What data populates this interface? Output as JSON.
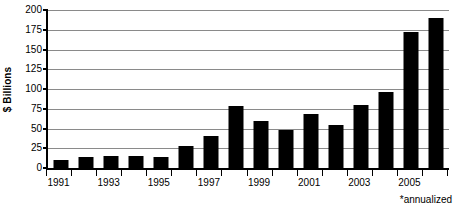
{
  "chart_data": {
    "type": "bar",
    "title": "",
    "xlabel": "",
    "ylabel": "$ Billions",
    "ylim": [
      0,
      200
    ],
    "yticks": [
      0,
      25,
      50,
      75,
      100,
      125,
      150,
      175,
      200
    ],
    "ytick_labels": [
      "0",
      "25",
      "50",
      "75",
      "100",
      "125",
      "150",
      "175",
      "200"
    ],
    "grid": true,
    "legend": null,
    "categories": [
      "1991",
      "1992",
      "1993",
      "1994",
      "1995",
      "1996",
      "1997",
      "1998",
      "1999",
      "2000",
      "2001",
      "2002",
      "2003",
      "2004",
      "2005",
      "2006"
    ],
    "xtick_labels_visible": [
      "1991",
      "",
      "1993",
      "",
      "1995",
      "",
      "1997",
      "",
      "1999",
      "",
      "2001",
      "",
      "2003",
      "",
      "2005",
      ""
    ],
    "values": [
      10,
      14,
      15,
      15,
      14,
      28,
      40,
      78,
      60,
      48,
      68,
      55,
      80,
      96,
      172,
      190
    ],
    "annotations": [
      "*annualized"
    ],
    "footnote": "*annualized"
  }
}
